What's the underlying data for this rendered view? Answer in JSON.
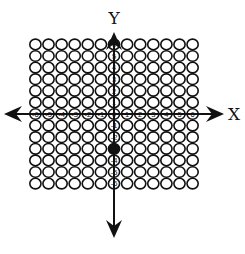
{
  "diagram": {
    "type": "coordinate-grid",
    "x_axis_label": "X",
    "y_axis_label": "Y",
    "x_range": [
      -6,
      6
    ],
    "y_range": [
      -6,
      6
    ],
    "x_tick_labels": [
      "-6",
      "-5",
      "-4",
      "-3",
      "-2",
      "-1",
      "0",
      "1",
      "2",
      "3",
      "4",
      "5",
      "6"
    ],
    "y_tick_labels": [
      "6",
      "5",
      "4",
      "3",
      "2",
      "1",
      "-1",
      "-2",
      "-4",
      "-5",
      "-6"
    ],
    "filled_points": [
      {
        "x": 0,
        "y": -3
      }
    ],
    "colors": {
      "stroke": "#111111",
      "fill_point": "#111111",
      "background": "#ffffff"
    }
  }
}
